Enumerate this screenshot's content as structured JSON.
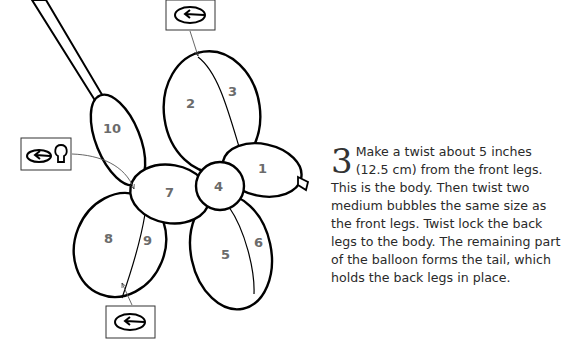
{
  "diagram": {
    "balloon_labels": [
      "1",
      "2",
      "3",
      "4",
      "5",
      "6",
      "7",
      "8",
      "9",
      "10"
    ],
    "icons": [
      {
        "name": "twist-icon-top",
        "meaning": "twist"
      },
      {
        "name": "twist-lock-icon-left",
        "meaning": "twist lock"
      },
      {
        "name": "twist-icon-bottom",
        "meaning": "twist"
      }
    ],
    "colors": {
      "stroke": "#000000",
      "label": "#6b6b6b",
      "background": "#ffffff"
    }
  },
  "instruction": {
    "step_number": "3",
    "text": "Make a twist about 5 inches (12.5 cm) from the front legs. This is the body. Then twist two medium bubbles the same size as the front legs. Twist lock the back legs to the body. The remaining part of the balloon forms the tail, which holds the back legs in place."
  }
}
